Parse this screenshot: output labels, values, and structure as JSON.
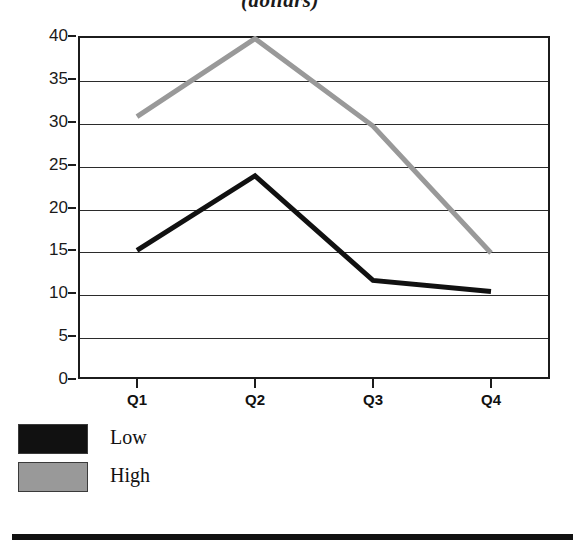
{
  "chart_data": {
    "type": "line",
    "title": "(dollars)",
    "xlabel": "",
    "ylabel": "",
    "categories": [
      "Q1",
      "Q2",
      "Q3",
      "Q4"
    ],
    "series": [
      {
        "name": "Low",
        "color": "#111111",
        "values": [
          15.0,
          23.7,
          11.5,
          10.2
        ]
      },
      {
        "name": "High",
        "color": "#999999",
        "values": [
          30.6,
          39.7,
          29.5,
          14.7
        ]
      }
    ],
    "ylim": [
      0,
      40
    ],
    "yticks": [
      0,
      5,
      10,
      15,
      20,
      25,
      30,
      35,
      40
    ],
    "ytick_labels": [
      "0",
      "5",
      "10",
      "15",
      "20",
      "25",
      "30",
      "35",
      "40"
    ],
    "grid": true,
    "legend_position": "below-left"
  },
  "legend": {
    "entries": [
      {
        "label": "Low",
        "color": "#111111"
      },
      {
        "label": "High",
        "color": "#999999"
      }
    ]
  },
  "colors": {
    "low": "#111111",
    "high": "#999999",
    "axis": "#1c1c1c",
    "grid": "#2b2b2b",
    "background": "#ffffff"
  }
}
